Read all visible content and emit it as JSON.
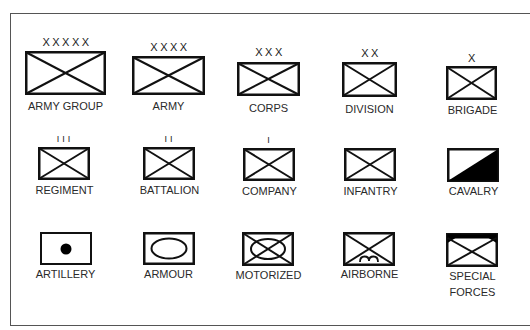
{
  "diagram": {
    "stroke_color": "#111111",
    "fill_color": "#000000"
  },
  "symbols": [
    {
      "id": "army-group",
      "label": "ARMY GROUP",
      "echelon_mark": "XXXXX",
      "type": "infantry-cross"
    },
    {
      "id": "army",
      "label": "ARMY",
      "echelon_mark": "XXXX",
      "type": "infantry-cross"
    },
    {
      "id": "corps",
      "label": "CORPS",
      "echelon_mark": "XXX",
      "type": "infantry-cross"
    },
    {
      "id": "division",
      "label": "DIVISION",
      "echelon_mark": "XX",
      "type": "infantry-cross"
    },
    {
      "id": "brigade",
      "label": "BRIGADE",
      "echelon_mark": "X",
      "type": "infantry-cross"
    },
    {
      "id": "regiment",
      "label": "REGIMENT",
      "echelon_mark": "III",
      "type": "infantry-cross"
    },
    {
      "id": "battalion",
      "label": "BATTALION",
      "echelon_mark": "II",
      "type": "infantry-cross"
    },
    {
      "id": "company",
      "label": "COMPANY",
      "echelon_mark": "I",
      "type": "infantry-cross"
    },
    {
      "id": "infantry",
      "label": "INFANTRY",
      "echelon_mark": "",
      "type": "infantry-cross"
    },
    {
      "id": "cavalry",
      "label": "CAVALRY",
      "echelon_mark": "",
      "type": "diagonal-half-filled"
    },
    {
      "id": "artillery",
      "label": "ARTILLERY",
      "echelon_mark": "",
      "type": "center-dot"
    },
    {
      "id": "armour",
      "label": "ARMOUR",
      "echelon_mark": "",
      "type": "oval"
    },
    {
      "id": "motorized",
      "label": "MOTORIZED",
      "echelon_mark": "",
      "type": "cross-with-oval"
    },
    {
      "id": "airborne",
      "label": "AIRBORNE",
      "echelon_mark": "",
      "type": "cross-with-wings"
    },
    {
      "id": "special-forces",
      "label": "SPECIAL\nFORCES",
      "echelon_mark": "",
      "type": "cross-with-filled-top-corners"
    }
  ]
}
